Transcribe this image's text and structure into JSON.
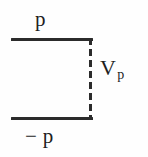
{
  "figure": {
    "kind": "line-diagram",
    "background_color": "#fefefe",
    "stroke_color": "#2b2b2b",
    "text_color": "#1f1f1f",
    "labels": {
      "top": "p",
      "bottom": "− p",
      "right_base": "V",
      "right_subscript": "p"
    }
  },
  "chart_data": {
    "type": "line",
    "title": "",
    "xlabel": "",
    "ylabel": "",
    "grid": false,
    "legend": null,
    "annotations": [
      {
        "text": "p",
        "position": "above-top-line"
      },
      {
        "text": "− p",
        "position": "below-bottom-line"
      },
      {
        "text": "V",
        "subscript": "p",
        "position": "right-of-dashed-line"
      }
    ],
    "series": [
      {
        "name": "upper-level",
        "style": "solid",
        "value": "p",
        "x": [
          0,
          1
        ],
        "y": [
          1,
          1
        ]
      },
      {
        "name": "lower-level",
        "style": "solid",
        "value": "-p",
        "x": [
          0,
          1
        ],
        "y": [
          -1,
          -1
        ]
      },
      {
        "name": "vertical-transition",
        "style": "dashed",
        "value": "V_p",
        "x": [
          1,
          1
        ],
        "y": [
          1,
          -1
        ]
      }
    ],
    "xlim": [
      0,
      1
    ],
    "ylim": [
      -1,
      1
    ]
  }
}
